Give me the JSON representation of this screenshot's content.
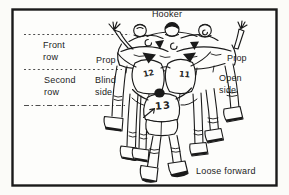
{
  "diagram": {
    "labels": {
      "hooker": "Hooker",
      "front_row": "Front row",
      "prop_left": "Prop",
      "prop_right": "Prop",
      "second_row": "Second row",
      "blind_side": "Blind side",
      "open_side": "Open side",
      "loose_forward": "Loose forward"
    },
    "jersey_numbers": {
      "blind_side_second_row": "12",
      "open_side_second_row": "11",
      "loose_forward": "13"
    },
    "colors": {
      "ink": "#1c1c1c",
      "paper": "#fdfdfb"
    }
  }
}
